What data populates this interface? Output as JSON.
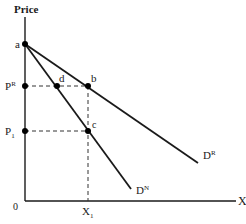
{
  "diagram": {
    "type": "economics-demand-curves",
    "axes": {
      "y_label": "Price",
      "x_label": "X",
      "origin_label": "0"
    },
    "price_levels": [
      {
        "label": "P",
        "superscript": "R"
      },
      {
        "label": "P",
        "subscript": "1"
      }
    ],
    "quantity_levels": [
      {
        "label": "X",
        "subscript": "1"
      }
    ],
    "points": [
      "a",
      "b",
      "c",
      "d"
    ],
    "curves": [
      {
        "label": "D",
        "superscript": "R",
        "from": "a",
        "through": "b"
      },
      {
        "label": "D",
        "superscript": "N",
        "from": "a",
        "through": [
          "d",
          "c"
        ]
      }
    ],
    "colors": {
      "line": "#1a1a1a",
      "dashed": "#333333"
    }
  },
  "labels": {
    "price": "Price",
    "x_axis": "X",
    "origin": "0",
    "a": "a",
    "b": "b",
    "c": "c",
    "d": "d",
    "pr_main": "P",
    "pr_sup": "R",
    "p1_main": "P",
    "p1_sub": "1",
    "x1_main": "X",
    "x1_sub": "1",
    "dr_main": "D",
    "dr_sup": "R",
    "dn_main": "D",
    "dn_sup": "N"
  }
}
